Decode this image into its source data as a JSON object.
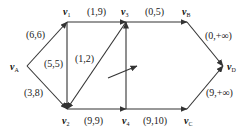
{
  "nodes": [
    {
      "id": "vA",
      "base": "v",
      "sub": "A",
      "x": 27,
      "y": 66,
      "lx": 10,
      "ly": 70
    },
    {
      "id": "v1",
      "base": "v",
      "sub": "1",
      "x": 67,
      "y": 22,
      "lx": 63,
      "ly": 15
    },
    {
      "id": "v3",
      "base": "v",
      "sub": "3",
      "x": 126,
      "y": 22,
      "lx": 121,
      "ly": 15
    },
    {
      "id": "vB",
      "base": "v",
      "sub": "B",
      "x": 187,
      "y": 22,
      "lx": 182,
      "ly": 15
    },
    {
      "id": "vD",
      "base": "v",
      "sub": "D",
      "x": 223,
      "y": 66,
      "lx": 227,
      "ly": 70
    },
    {
      "id": "v2",
      "base": "v",
      "sub": "2",
      "x": 67,
      "y": 109,
      "lx": 62,
      "ly": 124
    },
    {
      "id": "v4",
      "base": "v",
      "sub": "4",
      "x": 126,
      "y": 109,
      "lx": 122,
      "ly": 124
    },
    {
      "id": "vC",
      "base": "v",
      "sub": "C",
      "x": 187,
      "y": 109,
      "lx": 184,
      "ly": 124
    }
  ],
  "edges": [
    {
      "from": "vA",
      "to": "v1",
      "label": "(6,6)",
      "lx": 26,
      "ly": 38
    },
    {
      "from": "vA",
      "to": "v2",
      "label": "(3,8)",
      "lx": 24,
      "ly": 96
    },
    {
      "from": "v1",
      "to": "v3",
      "label": "(1,9)",
      "lx": 87,
      "ly": 15
    },
    {
      "from": "v1",
      "to": "v2",
      "label": "(5,5)",
      "lx": 44,
      "ly": 67
    },
    {
      "from": "v3",
      "to": "v2",
      "label": "(1,2)",
      "lx": 75,
      "ly": 62
    },
    {
      "from": "v2",
      "to": "v4",
      "label": "(9,9)",
      "lx": 84,
      "ly": 124
    },
    {
      "from": "v4",
      "to": "v3",
      "label": "",
      "lx": 0,
      "ly": 0
    },
    {
      "from": "v3",
      "to": "vB",
      "label": "(0,5)",
      "lx": 145,
      "ly": 15
    },
    {
      "from": "v4",
      "to": "vC",
      "label": "(9,10)",
      "lx": 143,
      "ly": 124
    },
    {
      "from": "vB",
      "to": "vD",
      "label": "(0,+∞)",
      "lx": 205,
      "ly": 39
    },
    {
      "from": "vC",
      "to": "vD",
      "label": "(9,+∞)",
      "lx": 206,
      "ly": 96
    }
  ],
  "free_arrow": {
    "x1": 108,
    "y1": 78,
    "x2": 137,
    "y2": 66
  },
  "colors": {
    "line": "#333333",
    "text": "#222222",
    "background": "#ffffff"
  }
}
